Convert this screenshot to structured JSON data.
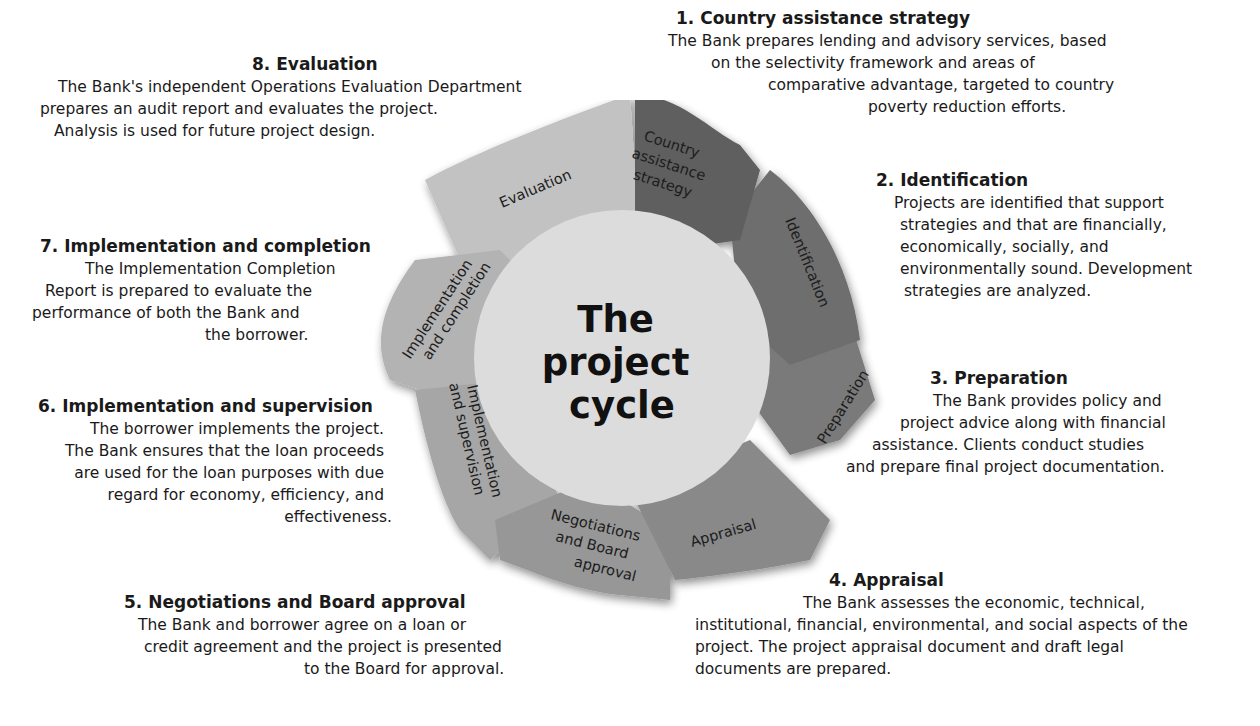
{
  "diagram": {
    "center_title": [
      "The",
      "project",
      "cycle"
    ],
    "colors": {
      "circle": "#dcdcdc",
      "seg_country": "#5e5e5e",
      "seg_identification": "#6e6e6e",
      "seg_preparation": "#7a7a7a",
      "seg_appraisal": "#898989",
      "seg_negotiations": "#979797",
      "seg_impl_supervision": "#a6a6a6",
      "seg_impl_completion": "#b3b3b3",
      "seg_evaluation": "#c2c2c2"
    },
    "segments": [
      {
        "label_lines": [
          "Country",
          "assistance",
          "strategy"
        ]
      },
      {
        "label_lines": [
          "Identification"
        ]
      },
      {
        "label_lines": [
          "Preparation"
        ]
      },
      {
        "label_lines": [
          "Appraisal"
        ]
      },
      {
        "label_lines": [
          "Negotiations",
          "and Board",
          "approval"
        ]
      },
      {
        "label_lines": [
          "Implementation",
          "and supervision"
        ]
      },
      {
        "label_lines": [
          "Implementation",
          "and completion"
        ]
      },
      {
        "label_lines": [
          "Evaluation"
        ]
      }
    ]
  },
  "steps": [
    {
      "title": "1. Country assistance strategy",
      "lines": [
        "The Bank prepares lending and advisory services, based",
        "on the selectivity framework and areas of",
        "comparative advantage, targeted to country",
        "poverty reduction efforts."
      ]
    },
    {
      "title": "2. Identification",
      "lines": [
        "Projects are identified that support",
        "strategies and that are financially,",
        "economically, socially, and",
        "environmentally sound. Development",
        "strategies are analyzed."
      ]
    },
    {
      "title": "3. Preparation",
      "lines": [
        "The Bank provides policy and",
        "project advice along with financial",
        "assistance. Clients conduct studies",
        "and prepare final project documentation."
      ]
    },
    {
      "title": "4. Appraisal",
      "lines": [
        "The Bank assesses the economic, technical,",
        "institutional, financial, environmental, and social aspects of the",
        "project. The project appraisal document and draft legal",
        "documents are prepared."
      ]
    },
    {
      "title": "5. Negotiations and Board approval",
      "lines": [
        "The Bank and borrower agree on a loan or",
        "credit agreement and the project is presented",
        "to the Board for approval."
      ]
    },
    {
      "title": "6. Implementation and supervision",
      "lines": [
        "The borrower implements the project.",
        "The Bank ensures that the loan proceeds",
        "are used for the loan purposes with due",
        "regard for economy, efficiency, and",
        "effectiveness."
      ]
    },
    {
      "title": "7. Implementation and completion",
      "lines": [
        "The Implementation Completion",
        "Report is prepared to evaluate the",
        "performance of both the Bank and",
        "the borrower."
      ]
    },
    {
      "title": "8. Evaluation",
      "lines": [
        "The Bank's independent Operations Evaluation Department",
        "prepares an audit report and evaluates the project.",
        "Analysis is used for future project design."
      ]
    }
  ]
}
